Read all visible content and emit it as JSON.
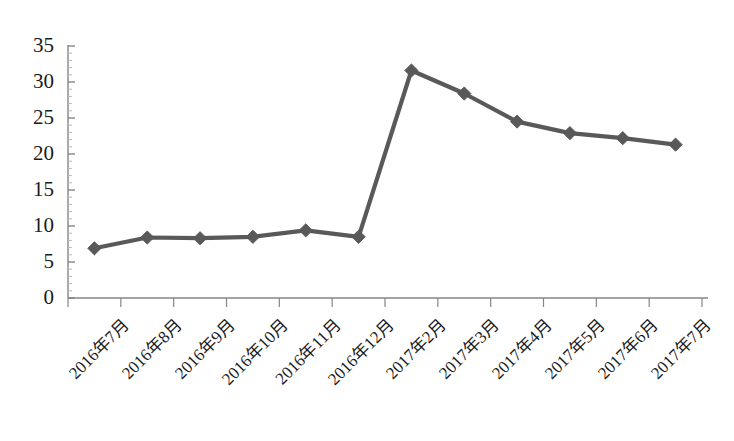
{
  "chart_data": {
    "type": "line",
    "title": "",
    "subtitle": "",
    "xlabel": "",
    "ylabel": "",
    "categories": [
      "2016年7月",
      "2016年8月",
      "2016年9月",
      "2016年10月",
      "2016年11月",
      "2016年12月",
      "2017年2月",
      "2017年3月",
      "2017年4月",
      "2017年5月",
      "2017年6月",
      "2017年7月"
    ],
    "values": [
      6.9,
      8.4,
      8.3,
      8.5,
      9.4,
      8.5,
      31.6,
      28.4,
      24.5,
      22.9,
      22.2,
      21.3
    ],
    "series": [
      {
        "name": "",
        "values": [
          6.9,
          8.4,
          8.3,
          8.5,
          9.4,
          8.5,
          31.6,
          28.4,
          24.5,
          22.9,
          22.2,
          21.3
        ]
      }
    ],
    "ylim": [
      0,
      35
    ],
    "ytick_labels": [
      "0",
      "5",
      "10",
      "15",
      "20",
      "25",
      "30",
      "35"
    ],
    "ytick_values": [
      0,
      5,
      10,
      15,
      20,
      25,
      30,
      35
    ],
    "grid": false,
    "legend": false,
    "legend_position": "none",
    "marker": "diamond",
    "series_color": "#595959",
    "axis_color": "#868686",
    "background_color": "#ffffff",
    "xtick_rotation": -45
  }
}
